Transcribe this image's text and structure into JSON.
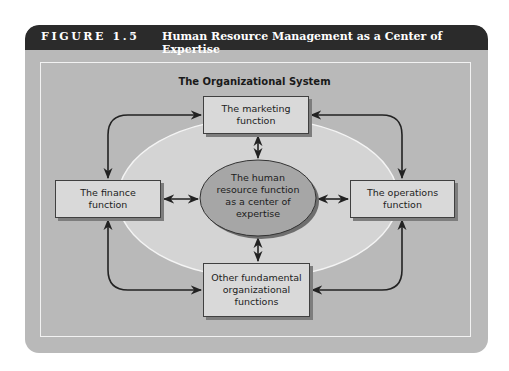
{
  "figure": {
    "label": "FIGURE 1.5",
    "title": "Human Resource Management as a Center of Expertise"
  },
  "diagram": {
    "system_title": "The Organizational System",
    "center": {
      "label": "The human resource function as a center of expertise",
      "lines": [
        "The human",
        "resource function",
        "as a center of",
        "expertise"
      ]
    },
    "nodes": {
      "marketing": {
        "label": "The marketing function",
        "lines": [
          "The marketing",
          "function"
        ]
      },
      "finance": {
        "label": "The finance function",
        "lines": [
          "The finance",
          "function"
        ]
      },
      "operations": {
        "label": "The operations function",
        "lines": [
          "The operations",
          "function"
        ]
      },
      "other": {
        "label": "Other fundamental organizational functions",
        "lines": [
          "Other fundamental",
          "organizational",
          "functions"
        ]
      }
    },
    "connections": [
      {
        "from": "center",
        "to": "marketing",
        "type": "bidirectional"
      },
      {
        "from": "center",
        "to": "finance",
        "type": "bidirectional"
      },
      {
        "from": "center",
        "to": "operations",
        "type": "bidirectional"
      },
      {
        "from": "center",
        "to": "other",
        "type": "bidirectional"
      },
      {
        "from": "finance",
        "to": "marketing",
        "type": "bidirectional"
      },
      {
        "from": "marketing",
        "to": "operations",
        "type": "bidirectional"
      },
      {
        "from": "operations",
        "to": "other",
        "type": "bidirectional"
      },
      {
        "from": "other",
        "to": "finance",
        "type": "bidirectional"
      }
    ]
  },
  "colors": {
    "header": "#2b2b2b",
    "panel": "#b9b9b9",
    "outer_ellipse": "#d4d4d4",
    "center_ellipse": "#a6a6a6",
    "box": "#d9d9d9"
  }
}
